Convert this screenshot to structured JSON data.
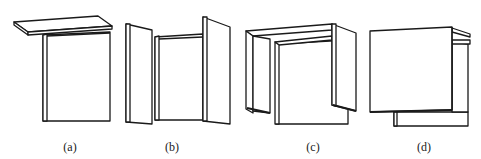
{
  "figure": {
    "panels": [
      {
        "id": "a",
        "label": "(a)",
        "description": "box with detached top lid"
      },
      {
        "id": "b",
        "label": "(b)",
        "description": "box with two side doors opened outward"
      },
      {
        "id": "c",
        "label": "(c)",
        "description": "box enclosed by inverted U-shaped cover"
      },
      {
        "id": "d",
        "label": "(d)",
        "description": "box with front panel and top flap"
      }
    ]
  },
  "colors": {
    "line": "#1a1a1a",
    "background": "#ffffff"
  }
}
